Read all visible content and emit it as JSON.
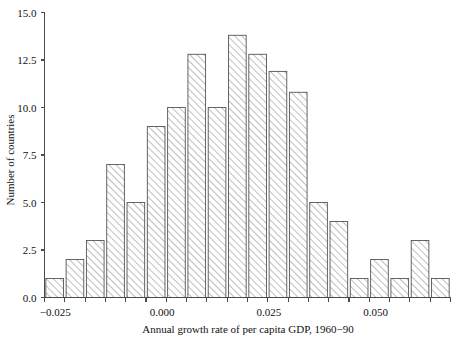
{
  "chart_data": {
    "type": "bar",
    "title": "",
    "subtitle": "",
    "xlabel": "Annual growth rate of per capita GDP, 1960−90",
    "ylabel": "Number of countries",
    "grid": false,
    "legend": "none",
    "xlim": [
      -0.0275,
      0.0675
    ],
    "ylim": [
      0,
      15
    ],
    "bin_width": 0.00475,
    "x_tick_labels": [
      "−0.025",
      "0.000",
      "0.025",
      "0.050"
    ],
    "x_tick_values": [
      -0.025,
      0.0,
      0.025,
      0.05
    ],
    "y_tick_labels": [
      "0.0",
      "2.5",
      "5.0",
      "7.5",
      "10.0",
      "12.5",
      "15.0"
    ],
    "y_tick_values": [
      0,
      2.5,
      5,
      7.5,
      10,
      12.5,
      15
    ],
    "categories": [
      "bin-01",
      "bin-02",
      "bin-03",
      "bin-04",
      "bin-05",
      "bin-06",
      "bin-07",
      "bin-08",
      "bin-09",
      "bin-10",
      "bin-11",
      "bin-12",
      "bin-13",
      "bin-14",
      "bin-15",
      "bin-16",
      "bin-17",
      "bin-18",
      "bin-19",
      "bin-20"
    ],
    "values": [
      1,
      2,
      3,
      7,
      5,
      9,
      10,
      12.8,
      10,
      13.8,
      12.8,
      11.9,
      10.8,
      5,
      4,
      1,
      2,
      1,
      3,
      1
    ],
    "bar_fill": "#ffffff",
    "bar_hatch": "diagonal-45",
    "bar_edge_color": "#555555",
    "axis_color": "#4a4a4a"
  }
}
